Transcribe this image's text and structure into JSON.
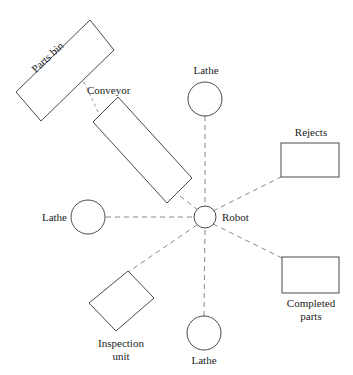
{
  "figure": {
    "background_color": "#ffffff",
    "outline_color": "#4a4a4a",
    "link_color": "#8a8a8a",
    "text_color": "#1c1c1c"
  },
  "nodes": {
    "parts_bin": {
      "label": "Parts bin",
      "shape": "rectangle"
    },
    "conveyor": {
      "label": "Conveyor",
      "shape": "rectangle"
    },
    "lathe_top": {
      "label": "Lathe",
      "shape": "circle"
    },
    "lathe_left": {
      "label": "Lathe",
      "shape": "circle"
    },
    "lathe_bottom": {
      "label": "Lathe",
      "shape": "circle"
    },
    "robot": {
      "label": "Robot",
      "shape": "circle"
    },
    "rejects": {
      "label": "Rejects",
      "shape": "rectangle"
    },
    "completed_parts": {
      "label_line1": "Completed",
      "label_line2": "parts",
      "shape": "rectangle"
    },
    "inspection_unit": {
      "label_line1": "Inspection",
      "label_line2": "unit",
      "shape": "rectangle"
    }
  }
}
